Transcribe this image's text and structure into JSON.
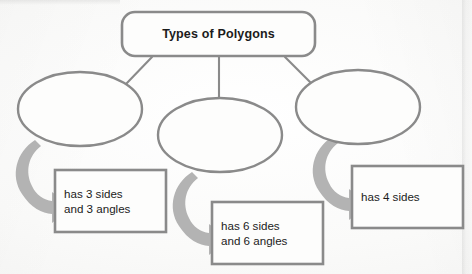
{
  "diagram": {
    "type": "hierarchy-graphic-organizer",
    "title_node": {
      "label": "Types of Polygons",
      "shape": "rounded-rectangle"
    },
    "category_nodes": [
      {
        "id": "category-left",
        "label": "",
        "shape": "ellipse"
      },
      {
        "id": "category-middle",
        "label": "",
        "shape": "ellipse"
      },
      {
        "id": "category-right",
        "label": "",
        "shape": "ellipse"
      }
    ],
    "detail_nodes": [
      {
        "id": "detail-left",
        "label": "has 3 sides\nand 3 angles",
        "shape": "rectangle"
      },
      {
        "id": "detail-middle",
        "label": "has 6 sides\nand 6 angles",
        "shape": "rectangle"
      },
      {
        "id": "detail-right",
        "label": "has 4 sides",
        "shape": "rectangle"
      }
    ],
    "connectors": [
      {
        "from": "title-node",
        "to": "category-left",
        "style": "line"
      },
      {
        "from": "title-node",
        "to": "category-middle",
        "style": "line"
      },
      {
        "from": "title-node",
        "to": "category-right",
        "style": "line"
      },
      {
        "from": "category-left",
        "to": "detail-left",
        "style": "curved-arrow"
      },
      {
        "from": "category-middle",
        "to": "detail-middle",
        "style": "curved-arrow"
      },
      {
        "from": "category-right",
        "to": "detail-right",
        "style": "curved-arrow"
      }
    ],
    "colors": {
      "outline": "#8a8a8a",
      "arrow": "#b3b3b3",
      "text": "#1b1b1b",
      "background": "#fbfbfa"
    }
  }
}
